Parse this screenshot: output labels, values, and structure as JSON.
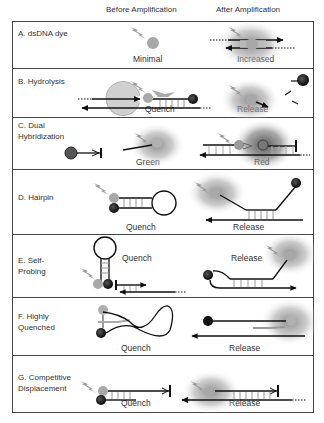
{
  "columns": {
    "before": "Before Amplification",
    "after": "After Amplification"
  },
  "panels": [
    {
      "id": "A",
      "label": "A. dsDNA dye",
      "before_caption": "Minimal",
      "after_caption": "Increased"
    },
    {
      "id": "B",
      "label": "B. Hydrolysis",
      "before_caption": "Quench",
      "after_caption": "Release"
    },
    {
      "id": "C",
      "label_line1": "C. Dual",
      "label_line2": "Hybridization",
      "before_caption": "Green",
      "after_caption": "Red"
    },
    {
      "id": "D",
      "label": "D. Hairpin",
      "before_caption": "Quench",
      "after_caption": "Release"
    },
    {
      "id": "E",
      "label_line1": "E. Self-",
      "label_line2": "Probing",
      "before_caption": "Quench",
      "after_caption": "Release"
    },
    {
      "id": "F",
      "label_line1": "F. Highly",
      "label_line2": "Quenched",
      "before_caption": "Quench",
      "after_caption": "Release"
    },
    {
      "id": "G",
      "label_line1": "G. Competitive",
      "label_line2": "Displacement",
      "before_caption": "Quench",
      "after_caption": "Release"
    }
  ],
  "colors": {
    "border": "#444444",
    "fluorophore": "#a8a8a8",
    "quencher": "#1a1a1a",
    "glow": "#8c8c8c",
    "strand": "#111111",
    "polymerase": "#cfcfcf"
  }
}
